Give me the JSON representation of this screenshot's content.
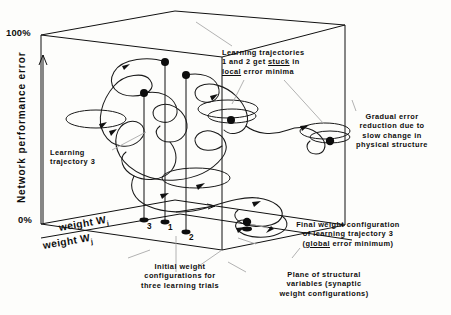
{
  "figure": {
    "type": "diagram"
  },
  "axes": {
    "vertical": {
      "label": "Network performance error",
      "max_tick": "100%",
      "min_tick": "0%"
    },
    "depth": {
      "label": "weight W",
      "subscript": "i"
    },
    "horizontal": {
      "label": "weight W",
      "subscript": "j"
    }
  },
  "point_labels": {
    "one": "1",
    "two": "2",
    "three": "3"
  },
  "annotations": {
    "local_minima": {
      "line1_a": "Learning trajectories",
      "line2_a": "1 and 2 get ",
      "line2_u": "stuck",
      "line2_b": " in",
      "line3_u": "local",
      "line3_b": " error minima"
    },
    "gradual": {
      "line1": "Gradual error",
      "line2": "reduction due to",
      "line3": "slow change in",
      "line4": "physical structure"
    },
    "trajectory3": {
      "line1": "Learning",
      "line2": "trajectory 3"
    },
    "final_config": {
      "line1": "Final weight configuration",
      "line2": "of learning trajectory 3",
      "line3_a": "(",
      "line3_u": "global",
      "line3_b": " error minimum)"
    },
    "initial_config": {
      "line1": "Initial weight",
      "line2": "configurations for",
      "line3": "three learning trials"
    },
    "plane": {
      "line1": "Plane of structural",
      "line2": "variables (synaptic",
      "line3": "weight configurations)"
    }
  },
  "colors": {
    "ink": "#0d0d0d",
    "leader": "#9a9a9a",
    "background": "#fdfdfb"
  }
}
